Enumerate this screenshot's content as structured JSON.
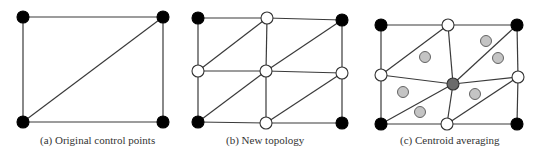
{
  "figure": {
    "panels": [
      {
        "id": "a",
        "caption": "(a) Original control points",
        "nodes": [
          {
            "x": 23,
            "y": 17,
            "type": "black"
          },
          {
            "x": 163,
            "y": 17,
            "type": "black"
          },
          {
            "x": 23,
            "y": 122,
            "type": "black"
          },
          {
            "x": 163,
            "y": 122,
            "type": "black"
          }
        ],
        "edges": [
          [
            0,
            1
          ],
          [
            1,
            3
          ],
          [
            3,
            2
          ],
          [
            2,
            0
          ],
          [
            2,
            1
          ]
        ]
      },
      {
        "id": "b",
        "caption": "(b) New topology",
        "nodes": [
          {
            "x": 198,
            "y": 18,
            "type": "black"
          },
          {
            "x": 267,
            "y": 18,
            "type": "white"
          },
          {
            "x": 342,
            "y": 20,
            "type": "black"
          },
          {
            "x": 198,
            "y": 71,
            "type": "white"
          },
          {
            "x": 266,
            "y": 71,
            "type": "white"
          },
          {
            "x": 342,
            "y": 73,
            "type": "white"
          },
          {
            "x": 198,
            "y": 122,
            "type": "black"
          },
          {
            "x": 266,
            "y": 123,
            "type": "white"
          },
          {
            "x": 342,
            "y": 123,
            "type": "black"
          }
        ],
        "edges": [
          [
            0,
            1
          ],
          [
            1,
            2
          ],
          [
            3,
            4
          ],
          [
            4,
            5
          ],
          [
            6,
            7
          ],
          [
            7,
            8
          ],
          [
            0,
            3
          ],
          [
            3,
            6
          ],
          [
            1,
            4
          ],
          [
            4,
            7
          ],
          [
            2,
            5
          ],
          [
            5,
            8
          ],
          [
            3,
            1
          ],
          [
            4,
            2
          ],
          [
            6,
            4
          ],
          [
            7,
            5
          ]
        ]
      },
      {
        "id": "c",
        "caption": "(c) Centroid averaging",
        "nodes": [
          {
            "x": 381,
            "y": 25,
            "type": "black"
          },
          {
            "x": 448,
            "y": 25,
            "type": "white"
          },
          {
            "x": 517,
            "y": 25,
            "type": "black"
          },
          {
            "x": 381,
            "y": 75,
            "type": "white"
          },
          {
            "x": 453,
            "y": 84,
            "type": "gray"
          },
          {
            "x": 518,
            "y": 77,
            "type": "white"
          },
          {
            "x": 381,
            "y": 124,
            "type": "black"
          },
          {
            "x": 447,
            "y": 124,
            "type": "white"
          },
          {
            "x": 517,
            "y": 124,
            "type": "black"
          }
        ],
        "edges": [
          [
            0,
            1
          ],
          [
            1,
            2
          ],
          [
            3,
            4
          ],
          [
            4,
            5
          ],
          [
            6,
            7
          ],
          [
            7,
            8
          ],
          [
            0,
            3
          ],
          [
            3,
            6
          ],
          [
            1,
            4
          ],
          [
            4,
            7
          ],
          [
            2,
            5
          ],
          [
            5,
            8
          ],
          [
            3,
            1
          ],
          [
            4,
            2
          ],
          [
            6,
            4
          ],
          [
            7,
            5
          ]
        ],
        "centroids": [
          {
            "x": 425,
            "y": 57
          },
          {
            "x": 486,
            "y": 41
          },
          {
            "x": 498,
            "y": 58
          },
          {
            "x": 403,
            "y": 92
          },
          {
            "x": 420,
            "y": 112
          },
          {
            "x": 475,
            "y": 94
          }
        ]
      }
    ],
    "colors": {
      "edge": "#3a3a3a",
      "black_node": "#000000",
      "white_node": "#ffffff",
      "center_node": "#6b6b6b",
      "centroid": "#c4c4c4"
    }
  }
}
